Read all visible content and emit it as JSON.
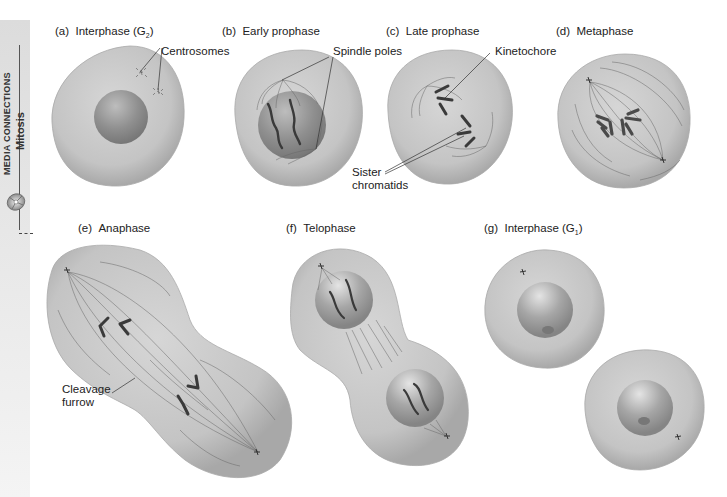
{
  "sidebar": {
    "section": "MEDIA CONNECTIONS",
    "topic": "Mitosis",
    "icon": "cd-disc-icon"
  },
  "panels": [
    {
      "id": "a",
      "letter": "(a)",
      "title": "Interphase (G",
      "sub": "2",
      "close": ")"
    },
    {
      "id": "b",
      "letter": "(b)",
      "title": "Early prophase",
      "sub": "",
      "close": ""
    },
    {
      "id": "c",
      "letter": "(c)",
      "title": "Late prophase",
      "sub": "",
      "close": ""
    },
    {
      "id": "d",
      "letter": "(d)",
      "title": "Metaphase",
      "sub": "",
      "close": ""
    },
    {
      "id": "e",
      "letter": "(e)",
      "title": "Anaphase",
      "sub": "",
      "close": ""
    },
    {
      "id": "f",
      "letter": "(f)",
      "title": "Telophase",
      "sub": "",
      "close": ""
    },
    {
      "id": "g",
      "letter": "(g)",
      "title": "Interphase (G",
      "sub": "1",
      "close": ")"
    }
  ],
  "annotations": {
    "centrosomes": "Centrosomes",
    "spindle_poles": "Spindle poles",
    "kinetochore": "Kinetochore",
    "sister_chromatids_1": "Sister",
    "sister_chromatids_2": "chromatids",
    "cleavage_furrow_1": "Cleavage",
    "cleavage_furrow_2": "furrow"
  },
  "colors": {
    "cell_fill": "#c8c8c8",
    "cell_edge": "#9a9a9a",
    "nucleus": "#8e8e8e",
    "chromosome": "#4a4a4a",
    "fiber": "#6a6a6a",
    "sidebar_bg": "#e2e2e2"
  }
}
